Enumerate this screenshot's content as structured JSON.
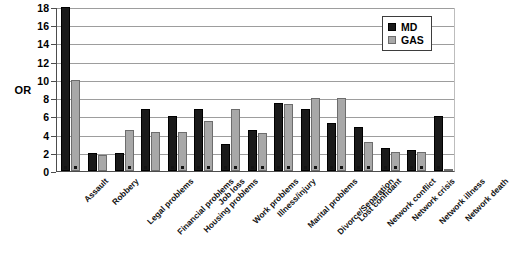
{
  "chart_data": {
    "type": "bar",
    "title": "",
    "xlabel": "",
    "ylabel": "OR",
    "ylim": [
      0,
      18
    ],
    "ytick_step": 2,
    "yticks": [
      0,
      2,
      4,
      6,
      8,
      10,
      12,
      14,
      16,
      18
    ],
    "grid": true,
    "legend_position": "top-right",
    "categories": [
      "Assault",
      "Robbery",
      "Legal problems",
      "Financial problems",
      "Housing problems",
      "Job loss",
      "Work problems",
      "Illness/injury",
      "Marital problems",
      "Divorce/Separation",
      "Lost confidant",
      "Network conflict",
      "Network crisis",
      "Network illness",
      "Network death"
    ],
    "series": [
      {
        "name": "MD",
        "color": "#1a1a1a",
        "values": [
          18.0,
          2.0,
          2.0,
          6.8,
          6.0,
          6.8,
          3.0,
          4.5,
          7.5,
          6.8,
          5.3,
          4.8,
          2.5,
          2.3,
          6.0
        ]
      },
      {
        "name": "GAS",
        "color": "#a8a8a8",
        "values": [
          10.0,
          1.8,
          4.5,
          4.3,
          4.3,
          5.5,
          6.8,
          4.2,
          7.4,
          8.0,
          8.0,
          3.2,
          2.1,
          2.1,
          0.2
        ]
      }
    ],
    "significance_markers": {
      "MD": [
        true,
        false,
        false,
        true,
        true,
        true,
        true,
        true,
        true,
        true,
        true,
        true,
        true,
        true,
        true
      ],
      "GAS": [
        true,
        false,
        true,
        false,
        true,
        true,
        true,
        true,
        true,
        true,
        true,
        true,
        true,
        true,
        false
      ]
    }
  },
  "legend": {
    "entries": [
      {
        "label": "MD",
        "swatch": "black-square"
      },
      {
        "label": "GAS",
        "swatch": "gray-square"
      }
    ]
  },
  "axis": {
    "y_title": "OR"
  }
}
